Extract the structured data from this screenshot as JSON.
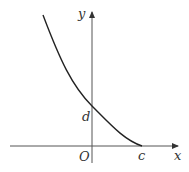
{
  "figure": {
    "labels": {
      "y_axis": "y",
      "x_axis": "x",
      "origin": "O",
      "y_intercept": "d",
      "x_intercept": "c"
    },
    "colors": {
      "curve": "#222222",
      "axes": "#555555",
      "text": "#333333"
    }
  }
}
